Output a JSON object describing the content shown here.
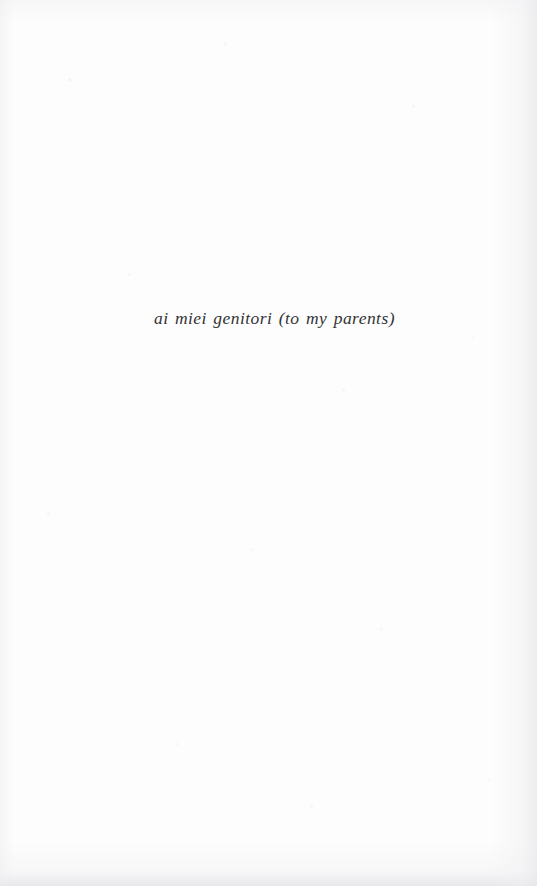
{
  "page": {
    "kind": "scanned-book-dedication-page",
    "background_color": "#fdfdfd",
    "width_px": 537,
    "height_px": 886
  },
  "dedication": {
    "text": "ai miei genitori (to my parents)",
    "language": "Italian with English translation",
    "style": "italic",
    "text_color": "#333335",
    "font_size_px": 17.5,
    "alignment": "center"
  }
}
